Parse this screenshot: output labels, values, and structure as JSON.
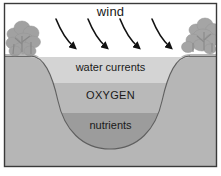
{
  "figure": {
    "frame": {
      "border_color": "#3a3a3a",
      "background_color": "#ffffff"
    },
    "sky": {
      "color": "#ffffff",
      "wind_label": "wind"
    },
    "arrows": {
      "name": "wind-arrows",
      "count": 4,
      "color": "#121212",
      "direction": "down-right"
    },
    "vegetation": {
      "left_label": "trees-left",
      "right_label": "trees-right",
      "color": "#9b9b9b"
    },
    "land": {
      "name": "land-mass",
      "color": "#b6b6b6",
      "outline_color": "#5c5c5c"
    },
    "layers": [
      {
        "id": "water-currents",
        "label": "water currents",
        "color": "#d4d4d4",
        "top": 57,
        "bottom": 83
      },
      {
        "id": "oxygen",
        "label": "OXYGEN",
        "color": "#b9b9b9",
        "top": 83,
        "bottom": 113
      },
      {
        "id": "nutrients",
        "label": "nutrients",
        "color": "#9c9c9c",
        "top": 113,
        "bottom": 150
      }
    ]
  }
}
